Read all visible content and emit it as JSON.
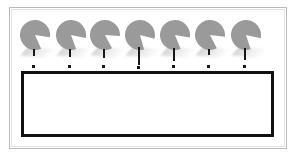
{
  "figure": {
    "title": "",
    "background_color": "#ffffff",
    "frame": {
      "label": "outer-frame",
      "border_color": "#b9b9b9",
      "inner_border_color": "#e2e2e2",
      "x": 9,
      "y": 7,
      "width": 278,
      "height": 142
    },
    "bar": {
      "label": "",
      "fill_color": "#ffffff",
      "border_color": "#111111",
      "border_width": 3,
      "x": 21,
      "y": 71,
      "width": 253,
      "height": 66
    },
    "disc_style": {
      "fill_color": "#9a9a9a",
      "stem_color": "#171717",
      "shadow_color": "#c9c9c9",
      "diameter": 30,
      "count": 7
    },
    "discs": [
      {
        "id": "disc-1",
        "x": 18,
        "mouth_start_deg": 9,
        "mouth_end_deg": 66,
        "stem_top": 29,
        "stem_height": 7,
        "foot_top": 45
      },
      {
        "id": "disc-2",
        "x": 54,
        "mouth_start_deg": 12,
        "mouth_end_deg": 70,
        "stem_top": 29,
        "stem_height": 8,
        "foot_top": 45
      },
      {
        "id": "disc-3",
        "x": 88,
        "mouth_start_deg": 4,
        "mouth_end_deg": 62,
        "stem_top": 29,
        "stem_height": 9,
        "foot_top": 45
      },
      {
        "id": "disc-4",
        "x": 123,
        "mouth_start_deg": 14,
        "mouth_end_deg": 74,
        "stem_top": 27,
        "stem_height": 18,
        "foot_top": 46
      },
      {
        "id": "disc-5",
        "x": 158,
        "mouth_start_deg": 10,
        "mouth_end_deg": 68,
        "stem_top": 28,
        "stem_height": 13,
        "foot_top": 45
      },
      {
        "id": "disc-6",
        "x": 193,
        "mouth_start_deg": 7,
        "mouth_end_deg": 63,
        "stem_top": 29,
        "stem_height": 6,
        "foot_top": 45
      },
      {
        "id": "disc-7",
        "x": 229,
        "mouth_start_deg": 13,
        "mouth_end_deg": 72,
        "stem_top": 28,
        "stem_height": 12,
        "foot_top": 45
      }
    ]
  }
}
